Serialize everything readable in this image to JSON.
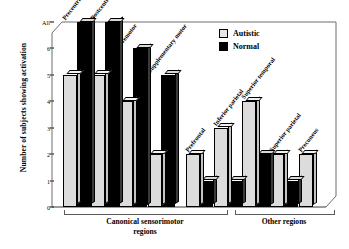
{
  "chart_data": {
    "type": "bar",
    "title": "",
    "xlabel": "",
    "ylabel": "Number of subjects showing activation",
    "ylim": [
      0,
      7
    ],
    "ytick_values": [
      0,
      1,
      2,
      3,
      4,
      5,
      6,
      7
    ],
    "ytick_labels": [
      "0",
      "1",
      "2",
      "3",
      "4",
      "5",
      "6",
      "All"
    ],
    "grid": false,
    "legend_position": "top-right",
    "categories": [
      "Precentral",
      "Postcentral",
      "Premotor",
      "Supplementary motor",
      "Prefrontal",
      "Inferior parietal",
      "Superior temporal",
      "Superior parietal",
      "Precuneus"
    ],
    "series": [
      {
        "name": "Autistic",
        "color": "#dcdcdc",
        "values": [
          5,
          5,
          4,
          2,
          2,
          3,
          4,
          2,
          2
        ]
      },
      {
        "name": "Normal",
        "color": "#000000",
        "values": [
          7,
          7,
          6,
          5,
          1,
          1,
          2,
          1,
          0
        ]
      }
    ],
    "groups": [
      {
        "label": "Canonical sensorimotor regions",
        "categories": [
          "Precentral",
          "Postcentral",
          "Premotor",
          "Supplementary motor"
        ]
      },
      {
        "label": "Other regions",
        "categories": [
          "Prefrontal",
          "Inferior parietal",
          "Superior temporal",
          "Superior parietal",
          "Precuneus"
        ]
      }
    ]
  },
  "legend": {
    "items": [
      {
        "label": "Autistic"
      },
      {
        "label": "Normal"
      }
    ]
  },
  "groups": {
    "left": {
      "line1": "Canonical sensorimotor",
      "line2": "regions"
    },
    "right": {
      "line1": "Other regions",
      "line2": ""
    }
  }
}
